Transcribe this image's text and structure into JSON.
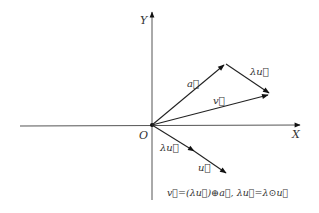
{
  "diagram": {
    "axes": {
      "x_label": "X",
      "y_label": "Y",
      "origin_label": "O"
    },
    "vectors": [
      {
        "name": "a",
        "label": "a⃗",
        "from": [
          152,
          125
        ],
        "to": [
          226,
          64
        ]
      },
      {
        "name": "lambda_u_top",
        "label": "λu⃗",
        "from": [
          226,
          64
        ],
        "to": [
          270,
          94
        ]
      },
      {
        "name": "v",
        "label": "v⃗",
        "from": [
          152,
          125
        ],
        "to": [
          270,
          94
        ]
      },
      {
        "name": "lambda_u_bottom",
        "label": "λu⃗",
        "from": [
          152,
          125
        ],
        "to": [
          194,
          151
        ]
      },
      {
        "name": "u",
        "label": "u⃗",
        "from": [
          152,
          125
        ],
        "to": [
          226,
          174
        ]
      }
    ],
    "labels": {
      "a": "a⃗",
      "lambda_u_top": "λu⃗",
      "v": "v⃗",
      "lambda_u_bottom": "λu⃗",
      "u": "u⃗"
    },
    "equation": "v⃗=(λu⃗)⊕a⃗, λu⃗=λ⊙u⃗"
  }
}
